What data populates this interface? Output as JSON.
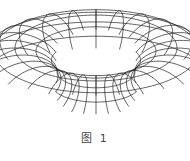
{
  "figure": {
    "shape": "torus",
    "style": "wireframe",
    "line_color": "#222222",
    "background": "#ffffff",
    "meridians": 28,
    "parallels": 12,
    "caption": "图 1"
  }
}
